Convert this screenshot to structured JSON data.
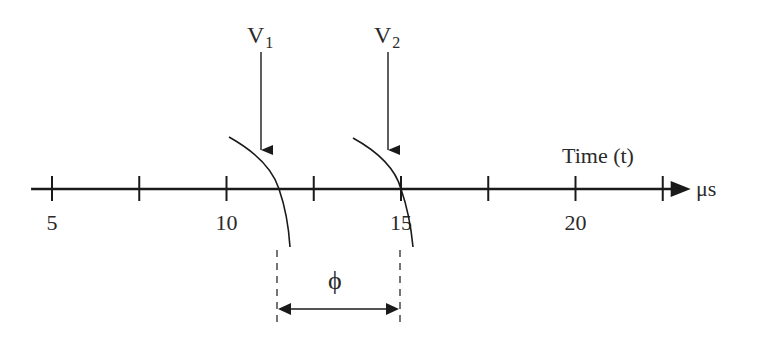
{
  "diagram": {
    "axis": {
      "label": "Time (t)",
      "unit": "μs",
      "ticks": [
        5,
        7.5,
        10,
        12.5,
        15,
        17.5,
        20,
        22.5
      ],
      "tick_labels": [
        "5",
        "10",
        "15",
        "20"
      ],
      "range": [
        4.4,
        23.3
      ]
    },
    "signals": [
      {
        "name": "V",
        "subscript": "1",
        "crossing_time": 11.5
      },
      {
        "name": "V",
        "subscript": "2",
        "crossing_time": 15
      }
    ],
    "phase": {
      "symbol": "ϕ",
      "from_time": 11.5,
      "to_time": 15
    },
    "colors": {
      "line": "#1a1a1a",
      "text": "#2a2a2a",
      "background": "#ffffff"
    }
  }
}
